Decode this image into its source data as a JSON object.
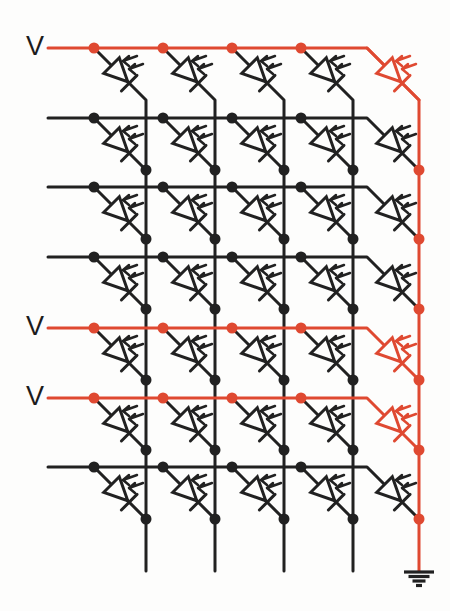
{
  "figure": {
    "type": "circuit-schematic",
    "row_label_text": "V",
    "colors": {
      "background": "#fdfdfc",
      "wire_black": "#212121",
      "wire_red": "#df4931",
      "label_text": "#1c1c1c"
    },
    "canvas": {
      "width": 450,
      "height": 611
    },
    "rows": [
      {
        "y": 48,
        "color": "red",
        "label": "V"
      },
      {
        "y": 118,
        "color": "black",
        "label": ""
      },
      {
        "y": 187,
        "color": "black",
        "label": ""
      },
      {
        "y": 257,
        "color": "black",
        "label": ""
      },
      {
        "y": 328,
        "color": "red",
        "label": "V"
      },
      {
        "y": 398,
        "color": "red",
        "label": "V"
      },
      {
        "y": 467,
        "color": "black",
        "label": ""
      }
    ],
    "columns": [
      {
        "x": 146,
        "color": "black",
        "grounded": false
      },
      {
        "x": 215,
        "color": "black",
        "grounded": false
      },
      {
        "x": 284,
        "color": "black",
        "grounded": false
      },
      {
        "x": 353,
        "color": "black",
        "grounded": false
      },
      {
        "x": 419,
        "color": "red",
        "grounded": true
      }
    ],
    "geometry": {
      "row_start_x": 48,
      "tap_offset": 52,
      "drop": 52,
      "column_bottom_y": 571,
      "stroke_width": 3,
      "dot_radius": 5.5,
      "label_x": 35,
      "label_dy": 7
    },
    "ground": {
      "bar_widths": [
        30,
        21,
        13,
        6
      ],
      "bar_gap": 4.5,
      "bar_thickness": 3.2
    }
  }
}
